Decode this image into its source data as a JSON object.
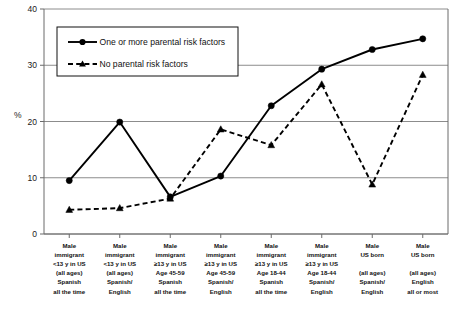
{
  "chart_data": {
    "type": "line",
    "title": "",
    "xlabel": "",
    "ylabel": "%",
    "ylim": [
      0,
      40
    ],
    "yticks": [
      0,
      10,
      20,
      30,
      40
    ],
    "ytick_labels": [
      "0",
      "10",
      "20",
      "30",
      "40"
    ],
    "grid": "horizontal",
    "legend_position": "upper-left-inside",
    "categories": [
      "Male immigrant <13 y in US (all ages) Spanish all the time",
      "Male immigrant <13 y in US (all ages) Spanish/ English",
      "Male immigrant ≥13 y in US Age 45-59 Spanish all the time",
      "Male immigrant ≥13 y in US Age 45-59 Spanish/ English",
      "Male immigrant ≥13 y in US Age 18-44 Spanish all the time",
      "Male immigrant ≥13 y in US Age 18-44 Spanish/ English",
      "Male US born (all ages) Spanish/ English",
      "Male US born (all ages) English all or most"
    ],
    "category_lines": [
      [
        "Male",
        "immigrant",
        "<13 y in US",
        "(all ages)",
        "Spanish",
        "all the time"
      ],
      [
        "Male",
        "immigrant",
        "<13 y in US",
        "(all ages)",
        "Spanish/",
        "English"
      ],
      [
        "Male",
        "immigrant",
        "≥13 y in US",
        "Age 45-59",
        "Spanish",
        "all the time"
      ],
      [
        "Male",
        "immigrant",
        "≥13 y in US",
        "Age 45-59",
        "Spanish/",
        "English"
      ],
      [
        "Male",
        "immigrant",
        "≥13 y in US",
        "Age 18-44",
        "Spanish",
        "all the time"
      ],
      [
        "Male",
        "immigrant",
        "≥13 y in US",
        "Age 18-44",
        "Spanish/",
        "English"
      ],
      [
        "Male",
        "US born",
        "",
        "(all ages)",
        "Spanish/",
        "English"
      ],
      [
        "Male",
        "US born",
        "",
        "(all ages)",
        "English",
        "all or most"
      ]
    ],
    "series": [
      {
        "name": "One or more parental risk factors",
        "marker": "circle",
        "line_style": "solid",
        "color": "#000000",
        "values": [
          9.5,
          19.9,
          6.6,
          10.3,
          22.8,
          29.3,
          32.8,
          34.7
        ]
      },
      {
        "name": "No parental risk factors",
        "marker": "triangle",
        "line_style": "dashed",
        "color": "#000000",
        "values": [
          4.3,
          4.6,
          6.3,
          18.6,
          15.8,
          26.6,
          8.8,
          28.3
        ]
      }
    ]
  },
  "legend": {
    "entries": [
      {
        "label": "One or more parental risk factors"
      },
      {
        "label": "No parental risk factors"
      }
    ]
  },
  "caption": {
    "text": ""
  }
}
